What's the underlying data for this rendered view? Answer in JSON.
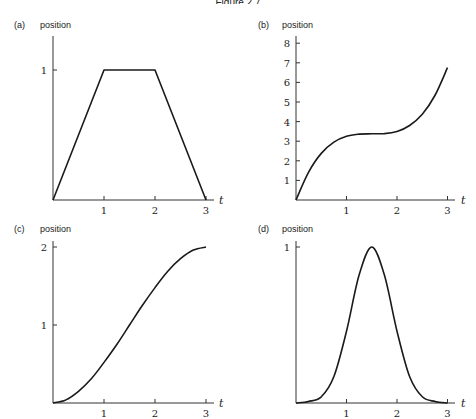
{
  "figure": {
    "title_fragment": "Figure 2.7",
    "colors": {
      "curve": "#1a1a1a",
      "axis": "#333333",
      "background": "#ffffff"
    }
  },
  "chart_data": [
    {
      "id": "a",
      "type": "line",
      "panel_label": "(a)",
      "title": "",
      "ylabel": "position",
      "xlabel": "t",
      "xlim": [
        0,
        3.1
      ],
      "ylim": [
        0,
        1.25
      ],
      "xticks": [
        "1",
        "2",
        "3"
      ],
      "yticks": [
        "1"
      ],
      "grid": false,
      "x": [
        0,
        1,
        2,
        3
      ],
      "series": [
        {
          "name": "position",
          "values": [
            0,
            1,
            1,
            0
          ]
        }
      ]
    },
    {
      "id": "b",
      "type": "line",
      "panel_label": "(b)",
      "title": "",
      "ylabel": "position",
      "xlabel": "t",
      "xlim": [
        0,
        3.1
      ],
      "ylim": [
        0,
        8.3
      ],
      "xticks": [
        "1",
        "2",
        "3"
      ],
      "yticks": [
        "1",
        "2",
        "3",
        "4",
        "5",
        "6",
        "7",
        "8"
      ],
      "grid": false,
      "x": [
        0,
        0.25,
        0.5,
        0.75,
        1,
        1.25,
        1.5,
        1.75,
        2,
        2.25,
        2.5,
        2.75,
        3
      ],
      "series": [
        {
          "name": "position",
          "values": [
            0,
            1.42,
            2.38,
            2.95,
            3.25,
            3.36,
            3.38,
            3.39,
            3.5,
            3.8,
            4.38,
            5.33,
            6.75
          ]
        }
      ]
    },
    {
      "id": "c",
      "type": "line",
      "panel_label": "(c)",
      "title": "",
      "ylabel": "position",
      "xlabel": "t",
      "xlim": [
        0,
        3.1
      ],
      "ylim": [
        0,
        2.1
      ],
      "xticks": [
        "1",
        "2",
        "3"
      ],
      "yticks": [
        "1",
        "2"
      ],
      "grid": false,
      "x": [
        0,
        0.25,
        0.5,
        0.75,
        1,
        1.25,
        1.5,
        1.75,
        2,
        2.25,
        2.5,
        2.75,
        3
      ],
      "series": [
        {
          "name": "position",
          "values": [
            0,
            0.04,
            0.15,
            0.31,
            0.52,
            0.75,
            1.0,
            1.25,
            1.48,
            1.69,
            1.85,
            1.96,
            2.0
          ]
        }
      ]
    },
    {
      "id": "d",
      "type": "line",
      "panel_label": "(d)",
      "title": "",
      "ylabel": "position",
      "xlabel": "t",
      "xlim": [
        0,
        3.1
      ],
      "ylim": [
        0,
        1.05
      ],
      "xticks": [
        "1",
        "2",
        "3"
      ],
      "yticks": [
        "1"
      ],
      "grid": false,
      "x": [
        0,
        0.25,
        0.5,
        0.75,
        1,
        1.25,
        1.5,
        1.75,
        2,
        2.25,
        2.5,
        2.75,
        3
      ],
      "series": [
        {
          "name": "position",
          "values": [
            0.0,
            0.01,
            0.04,
            0.17,
            0.46,
            0.82,
            1.0,
            0.82,
            0.46,
            0.17,
            0.04,
            0.01,
            0.0
          ]
        }
      ]
    }
  ]
}
